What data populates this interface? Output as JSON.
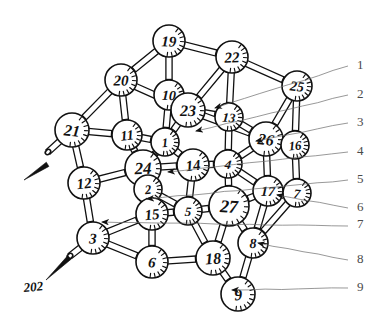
{
  "figure": {
    "kind": "ball-and-stick lattice diagram",
    "style": "hand-drawn ink line art",
    "background_color": "#ffffff",
    "ink_color": "#111111",
    "leader_color": "#6b6b6b",
    "width": 380,
    "height": 328
  },
  "callout_label": {
    "text": "202",
    "x": 24,
    "y": 292
  },
  "margin_labels": [
    {
      "text": "1",
      "x": 357,
      "y": 69
    },
    {
      "text": "2",
      "x": 357,
      "y": 98
    },
    {
      "text": "3",
      "x": 357,
      "y": 126
    },
    {
      "text": "4",
      "x": 357,
      "y": 155
    },
    {
      "text": "5",
      "x": 357,
      "y": 183
    },
    {
      "text": "6",
      "x": 357,
      "y": 211
    },
    {
      "text": "7",
      "x": 357,
      "y": 228
    },
    {
      "text": "8",
      "x": 357,
      "y": 263
    },
    {
      "text": "9",
      "x": 357,
      "y": 291
    }
  ],
  "leaders": [
    {
      "label": "1",
      "x1": 348,
      "y1": 66,
      "x2": 215,
      "y2": 108
    },
    {
      "label": "2",
      "x1": 348,
      "y1": 95,
      "x2": 196,
      "y2": 131
    },
    {
      "label": "3",
      "x1": 348,
      "y1": 123,
      "x2": 256,
      "y2": 141
    },
    {
      "label": "4",
      "x1": 348,
      "y1": 152,
      "x2": 168,
      "y2": 172
    },
    {
      "label": "5",
      "x1": 348,
      "y1": 180,
      "x2": 147,
      "y2": 199
    },
    {
      "label": "6",
      "x1": 348,
      "y1": 208,
      "x2": 277,
      "y2": 195
    },
    {
      "label": "7",
      "x1": 348,
      "y1": 226,
      "x2": 102,
      "y2": 222
    },
    {
      "label": "8",
      "x1": 348,
      "y1": 260,
      "x2": 258,
      "y2": 243
    },
    {
      "label": "9",
      "x1": 348,
      "y1": 288,
      "x2": 232,
      "y2": 290
    }
  ],
  "free_arrows": [
    {
      "name": "upper-left-direction-arrow",
      "x1": 48,
      "y1": 165,
      "x2": 24,
      "y2": 180
    },
    {
      "name": "lower-left-callout-arrow",
      "x1": 70,
      "y1": 258,
      "x2": 46,
      "y2": 280
    }
  ],
  "nodes": [
    {
      "id": 19,
      "label": "19",
      "x": 169,
      "y": 41,
      "r": 16
    },
    {
      "id": 22,
      "label": "22",
      "x": 232,
      "y": 57,
      "r": 16
    },
    {
      "id": 20,
      "label": "20",
      "x": 121,
      "y": 80,
      "r": 16
    },
    {
      "id": 25,
      "label": "25",
      "x": 297,
      "y": 86,
      "r": 15
    },
    {
      "id": 10,
      "label": "10",
      "x": 169,
      "y": 95,
      "r": 15
    },
    {
      "id": 23,
      "label": "23",
      "x": 188,
      "y": 110,
      "r": 17
    },
    {
      "id": 21,
      "label": "21",
      "x": 72,
      "y": 130,
      "r": 17
    },
    {
      "id": 11,
      "label": "11",
      "x": 127,
      "y": 135,
      "r": 15
    },
    {
      "id": 13,
      "label": "13",
      "x": 229,
      "y": 117,
      "r": 14
    },
    {
      "id": 26,
      "label": "26",
      "x": 266,
      "y": 139,
      "r": 17
    },
    {
      "id": 16,
      "label": "16",
      "x": 295,
      "y": 145,
      "r": 14
    },
    {
      "id": 1,
      "label": "1",
      "x": 165,
      "y": 142,
      "r": 14
    },
    {
      "id": 12,
      "label": "12",
      "x": 84,
      "y": 183,
      "r": 16
    },
    {
      "id": 24,
      "label": "24",
      "x": 143,
      "y": 168,
      "r": 18
    },
    {
      "id": 14,
      "label": "14",
      "x": 193,
      "y": 165,
      "r": 16
    },
    {
      "id": 4,
      "label": "4",
      "x": 228,
      "y": 164,
      "r": 14
    },
    {
      "id": 2,
      "label": "2",
      "x": 148,
      "y": 189,
      "r": 14
    },
    {
      "id": 17,
      "label": "17",
      "x": 268,
      "y": 191,
      "r": 15
    },
    {
      "id": 7,
      "label": "7",
      "x": 297,
      "y": 193,
      "r": 14
    },
    {
      "id": 15,
      "label": "15",
      "x": 152,
      "y": 214,
      "r": 16
    },
    {
      "id": 5,
      "label": "5",
      "x": 188,
      "y": 211,
      "r": 14
    },
    {
      "id": 27,
      "label": "27",
      "x": 229,
      "y": 206,
      "r": 20
    },
    {
      "id": 3,
      "label": "3",
      "x": 93,
      "y": 238,
      "r": 16
    },
    {
      "id": 8,
      "label": "8",
      "x": 253,
      "y": 243,
      "r": 15
    },
    {
      "id": 6,
      "label": "6",
      "x": 152,
      "y": 262,
      "r": 16
    },
    {
      "id": 18,
      "label": "18",
      "x": 213,
      "y": 258,
      "r": 17
    },
    {
      "id": 9,
      "label": "9",
      "x": 238,
      "y": 294,
      "r": 17
    }
  ],
  "bonds": [
    [
      19,
      20
    ],
    [
      19,
      10
    ],
    [
      19,
      22
    ],
    [
      22,
      13
    ],
    [
      22,
      25
    ],
    [
      22,
      23
    ],
    [
      20,
      11
    ],
    [
      20,
      23
    ],
    [
      20,
      21
    ],
    [
      25,
      16
    ],
    [
      25,
      26
    ],
    [
      10,
      23
    ],
    [
      10,
      1
    ],
    [
      23,
      13
    ],
    [
      23,
      1
    ],
    [
      23,
      26
    ],
    [
      21,
      11
    ],
    [
      21,
      12
    ],
    [
      11,
      1
    ],
    [
      11,
      24
    ],
    [
      13,
      26
    ],
    [
      13,
      4
    ],
    [
      26,
      16
    ],
    [
      26,
      4
    ],
    [
      26,
      17
    ],
    [
      16,
      7
    ],
    [
      1,
      14
    ],
    [
      1,
      24
    ],
    [
      12,
      24
    ],
    [
      12,
      3
    ],
    [
      24,
      14
    ],
    [
      24,
      2
    ],
    [
      24,
      15
    ],
    [
      14,
      4
    ],
    [
      14,
      5
    ],
    [
      4,
      27
    ],
    [
      4,
      17
    ],
    [
      2,
      15
    ],
    [
      2,
      5
    ],
    [
      17,
      7
    ],
    [
      17,
      27
    ],
    [
      17,
      8
    ],
    [
      7,
      8
    ],
    [
      15,
      5
    ],
    [
      15,
      6
    ],
    [
      5,
      27
    ],
    [
      5,
      18
    ],
    [
      27,
      18
    ],
    [
      27,
      8
    ],
    [
      3,
      15
    ],
    [
      3,
      6
    ],
    [
      8,
      9
    ],
    [
      6,
      18
    ],
    [
      18,
      9
    ]
  ],
  "stub_bonds": [
    {
      "from": 21,
      "x2": 48,
      "y2": 152
    },
    {
      "from": 3,
      "x2": 70,
      "y2": 256
    }
  ]
}
